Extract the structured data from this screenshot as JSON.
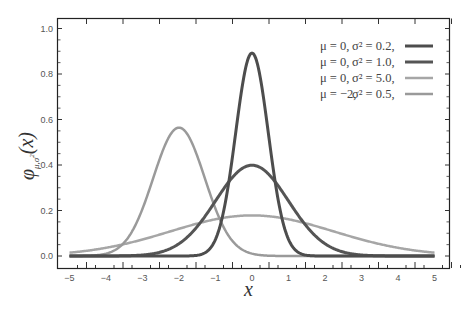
{
  "chart_data": {
    "type": "line",
    "title": "",
    "xlabel": "x",
    "ylabel": "φμ,σ²(x)",
    "ylabel_parts": {
      "base": "φ",
      "sub": "μ,σ",
      "sup": "2",
      "arg": "(x)"
    },
    "xlim": [
      -5,
      5
    ],
    "ylim": [
      0.0,
      1.0
    ],
    "grid": false,
    "legend_position": "upper right",
    "x_ticks": [
      -5,
      -4,
      -3,
      -2,
      -1,
      0,
      1,
      2,
      3,
      4,
      5
    ],
    "x_tick_labels": [
      "−5",
      "−4",
      "−3",
      "−2",
      "−1",
      "0",
      "1",
      "2",
      "3",
      "4",
      "5"
    ],
    "y_ticks": [
      0.0,
      0.2,
      0.4,
      0.6,
      0.8,
      1.0
    ],
    "y_tick_labels": [
      "0.0",
      "0.2",
      "0.4",
      "0.6",
      "0.8",
      "1.0"
    ],
    "function": "normal probability density",
    "series": [
      {
        "name": "μ=0,   σ²=0.2,",
        "mu": 0,
        "sigma2": 0.2,
        "color": "#4d4d4d",
        "width": 3,
        "peak": 0.892
      },
      {
        "name": "μ=0,   σ²=1.0,",
        "mu": 0,
        "sigma2": 1.0,
        "color": "#555555",
        "width": 3,
        "peak": 0.399
      },
      {
        "name": "μ=0,   σ²=5.0,",
        "mu": 0,
        "sigma2": 5.0,
        "color": "#a6a6a6",
        "width": 2.5,
        "peak": 0.178
      },
      {
        "name": "μ=−2, σ²=0.5,",
        "mu": -2,
        "sigma2": 0.5,
        "color": "#9a9a9a",
        "width": 2.5,
        "peak": 0.564
      }
    ]
  },
  "legend": {
    "entries": [
      {
        "mu": "μ = 0,",
        "sigma": "σ² = 0.2,"
      },
      {
        "mu": "μ = 0,",
        "sigma": "σ² = 1.0,"
      },
      {
        "mu": "μ = 0,",
        "sigma": "σ² = 5.0,"
      },
      {
        "mu": "μ = −2,",
        "sigma": "σ² = 0.5,"
      }
    ]
  },
  "axes": {
    "x_label": "x",
    "y_label_base": "φ",
    "y_label_sub": "μ,σ",
    "y_label_sup": "2",
    "y_label_arg": "(x)"
  }
}
